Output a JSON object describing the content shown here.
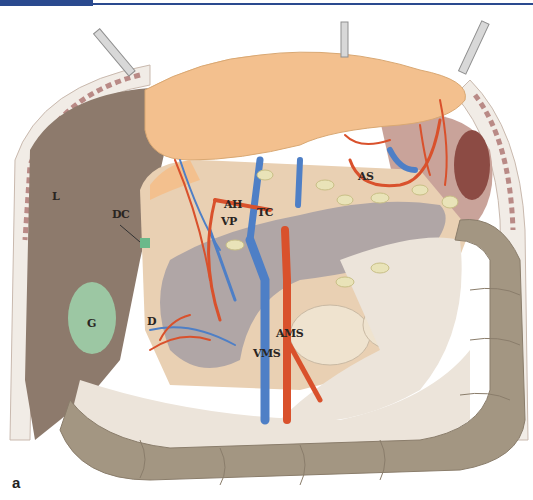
{
  "header": {
    "bar_color": "#2a4a8f"
  },
  "figure": {
    "panel_label": "a",
    "labels": [
      {
        "id": "L",
        "text": "L",
        "x": 52,
        "y": 197
      },
      {
        "id": "DC",
        "text": "DC",
        "x": 112,
        "y": 214
      },
      {
        "id": "AH",
        "text": "AH",
        "x": 224,
        "y": 204
      },
      {
        "id": "VP",
        "text": "VP",
        "x": 221,
        "y": 221
      },
      {
        "id": "TC",
        "text": "TC",
        "x": 257,
        "y": 212
      },
      {
        "id": "AS",
        "text": "AS",
        "x": 358,
        "y": 176
      },
      {
        "id": "G",
        "text": "G",
        "x": 87,
        "y": 323
      },
      {
        "id": "D",
        "text": "D",
        "x": 147,
        "y": 321
      },
      {
        "id": "AMS",
        "text": "AMS",
        "x": 276,
        "y": 333
      },
      {
        "id": "VMS",
        "text": "VMS",
        "x": 253,
        "y": 353
      }
    ]
  },
  "colors": {
    "liver": "#8d7a6c",
    "omentum": "#f3c08e",
    "colon": "#a39682",
    "pancreas": "#b0a6a6",
    "gallbladder": "#9cc7a3",
    "artery": "#d9512c",
    "vein": "#4e7fc6",
    "mesentery": "#ece4da",
    "bowel": "#efe3cf"
  }
}
